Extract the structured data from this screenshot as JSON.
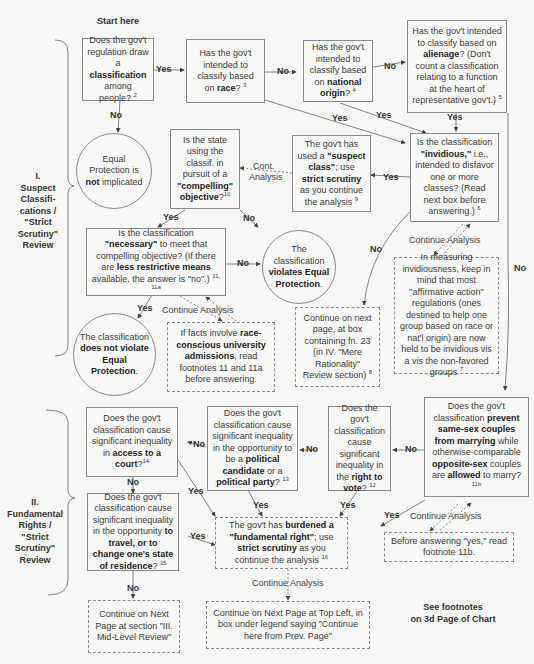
{
  "start_label": "Start here",
  "sections": {
    "suspect": {
      "line1": "I.",
      "line2": "Suspect",
      "line3": "Classifi-",
      "line4": "cations /",
      "line5": "\"Strict",
      "line6": "Scrutiny\"",
      "line7": "Review"
    },
    "fundamental": {
      "line1": "II.",
      "line2": "Fundamental",
      "line3": "Rights /",
      "line4": "\"Strict",
      "line5": "Scrutiny\"",
      "line6": "Review"
    }
  },
  "nodes": {
    "classification": {
      "pre": "Does the gov't regulation draw a ",
      "bold": "classification",
      "post": " among people?",
      "fn": "2"
    },
    "race": {
      "pre": "Has the gov't intended to classify based on ",
      "bold": "race",
      "post": "?",
      "fn": "3"
    },
    "national_origin": {
      "pre": "Has the gov't intended to classify based on ",
      "bold": "national origin",
      "post": "?",
      "fn": "4"
    },
    "alienage": {
      "pre": "Has the gov't intended to classify based on ",
      "bold": "alienage",
      "post": "? (Don't count a classification relating to a function at the heart of representative gov't.)",
      "fn": "5"
    },
    "not_implicated": {
      "pre": "Equal Protection is ",
      "bold": "not",
      "post": " implicated"
    },
    "compelling": {
      "pre": "Is the state using the classif. in pursuit of a ",
      "bold": "\"compelling\" objective",
      "post": "?",
      "fn": "10"
    },
    "suspect_class": {
      "pre": "The gov't has used a ",
      "bold": "\"suspect class\"",
      "mid": "; use ",
      "bold2": "strict scrutiny",
      "post": " as you continue the analysis",
      "fn": "9"
    },
    "invidious": {
      "pre": "Is the classification ",
      "bold": "\"invidious,\"",
      "post": " i.e., intended to disfavor one or more classes? (Read next box before answering.)",
      "fn": "6"
    },
    "necessary": {
      "pre": "Is the classification ",
      "bold": "\"necessary\"",
      "mid": " to meet that compelling objective? (If there are ",
      "bold2": "less restrictive means",
      "post": " available, the answer is \"no\".)",
      "fn": "11, 11a"
    },
    "violates": {
      "pre": "The classification ",
      "bold": "violates Equal Protection",
      "post": "."
    },
    "does_not_violate": {
      "pre": "The classification ",
      "bold": "does not violate Equal Protection",
      "post": "."
    },
    "race_admissions": {
      "pre": "If facts involve ",
      "bold": "race-conscious university admissions",
      "post": ", read footnotes 11 and 11a before answering."
    },
    "mere_rationality": {
      "pre": "Continue on next page, at box containing fn. 23 (in IV. \"Mere Rationality\" Review section)",
      "fn": "8"
    },
    "affirmative_action": {
      "pre": "In measuring invidiousness, keep in mind that most \"affirmative action\" regulations (ones destined to help one group based on race or nat'l origin) are now held to be invidious vis a vis the non-favored groups",
      "fn": "7"
    },
    "court": {
      "pre": "Does the gov't classification cause significant inequality in ",
      "bold": "access to a court",
      "post": "?",
      "fn": "14"
    },
    "political": {
      "pre": "Does the gov't classification cause significant inequality in the opportunity to be a ",
      "bold": "political candidate",
      "mid": " or a ",
      "bold2": "political party",
      "post": "?",
      "fn": "13"
    },
    "vote": {
      "pre": "Does the gov't classification cause significant inequality in the ",
      "bold": "right to vote",
      "post": "?",
      "fn": "12"
    },
    "same_sex": {
      "pre": "Does the gov't classification ",
      "bold": "prevent same-sex couples from marrying",
      "mid": " while otherwise-comparable ",
      "bold2": "opposite-sex",
      "mid2": " couples are ",
      "bold3": "allowed",
      "post": " to marry?",
      "fn": "11b"
    },
    "travel": {
      "pre": "Does the gov't classification cause significant inequality in the opportunity ",
      "bold": "to travel, or to change one's state of residence",
      "post": "?",
      "fn": "15"
    },
    "fundamental_right": {
      "pre": "The gov't has ",
      "bold": "burdened a \"fundamental right\"",
      "mid": "; use ",
      "bold2": "strict scrutiny",
      "post": " as you continue the analysis",
      "fn": "16"
    },
    "before_yes": {
      "pre": "Before answering \"yes,\" read footnote 11b."
    },
    "mid_level": {
      "pre": "Continue on Next Page at section \"III. Mid-Level Review\""
    },
    "next_page_top_left": {
      "pre": "Continue on Next Page at Top Left, in box under legend saying \"Continue here from Prev. Page\""
    }
  },
  "edge_labels": {
    "yes": "Yes",
    "no": "No",
    "continue_analysis": "Continue Analysis",
    "cont_analysis_1": "Cont.",
    "cont_analysis_2": "Analysis"
  },
  "footnote_note": {
    "line1": "See footnotes",
    "line2": "on 3d Page of Chart"
  }
}
